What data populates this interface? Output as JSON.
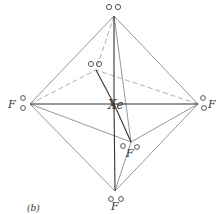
{
  "figure": {
    "panel_label": "(b)",
    "center_atom": "Xe",
    "colors": {
      "solid_line": "#8a8a8a",
      "bond_line": "#333333",
      "dashed_line": "#9a9a9a",
      "text": "#333333"
    },
    "atoms": [
      {
        "id": "left-F",
        "label": "F"
      },
      {
        "id": "right-F",
        "label": "F"
      },
      {
        "id": "front-F",
        "label": "F"
      },
      {
        "id": "bottom-F",
        "label": "F"
      }
    ],
    "lone_pairs": [
      {
        "id": "top-lone-pair"
      },
      {
        "id": "back-lone-pair"
      }
    ]
  }
}
